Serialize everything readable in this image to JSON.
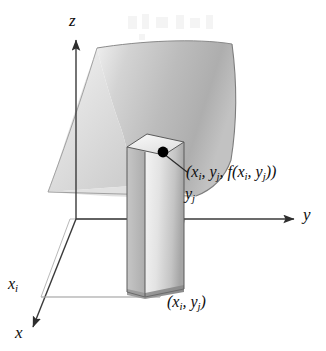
{
  "figure": {
    "kind": "3d-coordinate-surface-diagram",
    "background_color": "#ffffff",
    "ink_color": "#0d0d0d"
  },
  "axes": {
    "z_label": "z",
    "y_label": "y",
    "x_label": "x",
    "axis_color": "#3a3a3a"
  },
  "ticks": {
    "x_tick_label": "x",
    "x_tick_sub": "i",
    "y_tick_label": "y",
    "y_tick_sub": "j"
  },
  "annotations": {
    "surface_point_open": "(",
    "surface_point_x": "x",
    "surface_point_x_sub": "i",
    "surface_point_comma1": ", ",
    "surface_point_y": "y",
    "surface_point_y_sub": "j",
    "surface_point_comma2": ", ",
    "surface_point_f": "f",
    "surface_point_f_open": "(",
    "surface_point_fx": "x",
    "surface_point_fx_sub": "i",
    "surface_point_comma3": ", ",
    "surface_point_fy": "y",
    "surface_point_fy_sub": "j",
    "surface_point_close": "))",
    "base_point_open": "(",
    "base_point_x": "x",
    "base_point_x_sub": "i",
    "base_point_comma": ", ",
    "base_point_y": "y",
    "base_point_y_sub": "j",
    "base_point_close": ")"
  },
  "marker": {
    "name": "surface-point-dot",
    "color": "#000000",
    "radius_px": 5
  },
  "surface": {
    "description": "curved shaded sheet representing z = f(x, y)",
    "fill_light": "#e8e8e8",
    "fill_mid": "#bdbdbd",
    "fill_dark": "#9a9a9a",
    "edge_color": "#6e6e6e"
  },
  "column": {
    "description": "rectangular prism rising from base rectangle to the surface",
    "front_light": "#f2f2f2",
    "front_dark": "#a9a9a9",
    "side_fill": "#b5b5b5",
    "top_fill": "#efefef",
    "edge_color": "#5a5a5a"
  },
  "base_plane": {
    "grid_color": "#b9b9b9"
  }
}
